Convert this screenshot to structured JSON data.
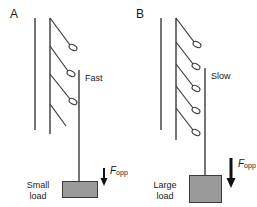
{
  "figure": {
    "panels": [
      {
        "id": "A",
        "label": "A",
        "speed_label": "Fast",
        "load_label_line1": "Small",
        "load_label_line2": "load",
        "force_symbol": "F",
        "force_subscript": "opp",
        "cross_bridge_count": 3,
        "load_box": {
          "x": 62,
          "y": 181,
          "width": 36,
          "height": 17
        },
        "arrow": {
          "x": 104,
          "y_top": 168,
          "y_bottom": 184,
          "head_width": 7,
          "shaft_width": 2
        }
      },
      {
        "id": "B",
        "label": "B",
        "speed_label": "Slow",
        "load_label_line1": "Large",
        "load_label_line2": "load",
        "force_symbol": "F",
        "force_subscript": "opp",
        "cross_bridge_count": 5,
        "load_box": {
          "x": 61,
          "y": 175,
          "width": 33,
          "height": 28
        },
        "arrow": {
          "x": 103,
          "y_top": 158,
          "y_bottom": 187,
          "head_width": 9,
          "shaft_width": 3
        }
      }
    ],
    "colors": {
      "stroke": "#3a3a3a",
      "load_fill": "#9a9a9a",
      "text": "#1a1a1a",
      "background": "#ffffff"
    },
    "geometry": {
      "actin_left_line": {
        "x": 35,
        "y_top": 18,
        "y_bottom": 130
      },
      "myosin_backbone": {
        "x": 50,
        "y_top": 18,
        "y_bottom": 134
      },
      "thin_filament_a": {
        "x": 79,
        "y_top": 70,
        "y_bottom": 182
      },
      "thin_filament_b": {
        "x": 77,
        "y_top": 68,
        "y_bottom": 176
      },
      "head_angle_dx": 22,
      "head_angle_dy": 30,
      "head_ellipse_rx": 4.2,
      "head_ellipse_ry": 2.6
    }
  }
}
